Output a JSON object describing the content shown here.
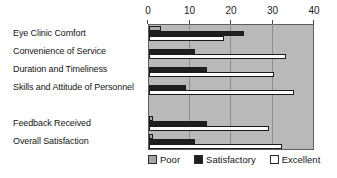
{
  "chart_data": {
    "type": "bar",
    "orientation": "horizontal",
    "title": "",
    "categories": [
      "Eye Clinic Comfort",
      "Convenience of Service",
      "Duration and Timeliness",
      "Skills and Attitude of Personnel",
      "",
      "Feedback Received",
      "Overall Satisfaction"
    ],
    "series": [
      {
        "name": "Poor",
        "color": "#a6a6a6",
        "values": [
          3,
          0,
          0,
          0,
          null,
          1,
          1
        ]
      },
      {
        "name": "Satisfactory",
        "color": "#1f1f1f",
        "values": [
          23,
          11,
          14,
          9,
          null,
          14,
          11
        ]
      },
      {
        "name": "Excellent",
        "color": "#fdfdfd",
        "values": [
          18,
          33,
          30,
          35,
          null,
          29,
          32
        ]
      }
    ],
    "xlim": [
      0,
      40
    ],
    "xticks": [
      "0",
      "10",
      "20",
      "30",
      "40"
    ],
    "grid": "vertical",
    "legend_position": "bottom",
    "plot_background": "#b9b9b9",
    "bar_border_color": "#1b1b1b",
    "axis_position": "top"
  }
}
